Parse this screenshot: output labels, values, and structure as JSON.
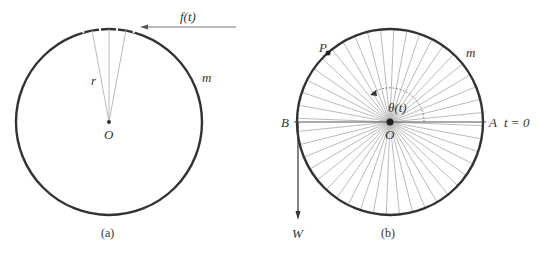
{
  "figure_a": {
    "caption": "(a)",
    "center_label": "O",
    "radius_label": "r",
    "mass_label": "m",
    "force_label": "f(t)",
    "center": [
      109,
      122
    ],
    "radius": 93
  },
  "figure_b": {
    "caption": "(b)",
    "center_label": "O",
    "point_label": "P",
    "mass_label": "m",
    "left_label": "B",
    "right_label": "A",
    "time_label": "t = 0",
    "angle_label": "θ(t)",
    "weight_label": "W",
    "center": [
      390,
      122
    ],
    "radius": 93,
    "spoke_count": 44
  },
  "colors": {
    "rim": "#333333",
    "spoke": "#aaaaaa",
    "text": "#333333"
  }
}
